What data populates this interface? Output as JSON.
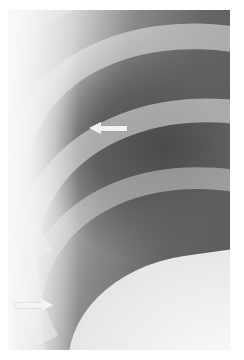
{
  "image": {
    "type": "chest radiograph",
    "description": "Oblique view of ribs over lung field with two white arrows indicating findings",
    "colors": {
      "background": "#ffffff",
      "lung_dark": "#4a4a4a",
      "bone_light": "#e8e8e8",
      "arrow": "#f4f4f4"
    }
  },
  "annotations": [
    {
      "name": "upper-arrow",
      "direction": "left",
      "x": 89,
      "y": 128
    },
    {
      "name": "lower-arrow",
      "direction": "right",
      "x": 15,
      "y": 305
    }
  ]
}
